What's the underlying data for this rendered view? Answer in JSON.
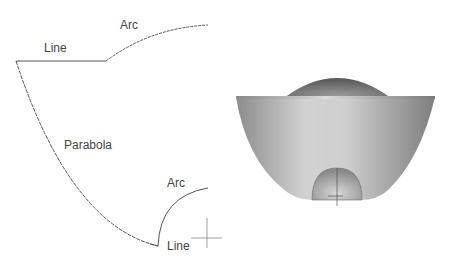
{
  "profile": {
    "labels": {
      "top_line": "Line",
      "top_arc": "Arc",
      "parabola": "Parabola",
      "bottom_arc": "Arc",
      "bottom_line": "Line"
    },
    "stroke_color": "#555555"
  },
  "solid": {
    "description": "Revolved solid: parabolic bowl with dome cap and small hemisphere at base",
    "colors": {
      "bowl_light": "#d4d4d4",
      "bowl_dark": "#8a8a8a",
      "dome": "#7a7a7a",
      "hemisphere": "#bdbdbd"
    }
  }
}
